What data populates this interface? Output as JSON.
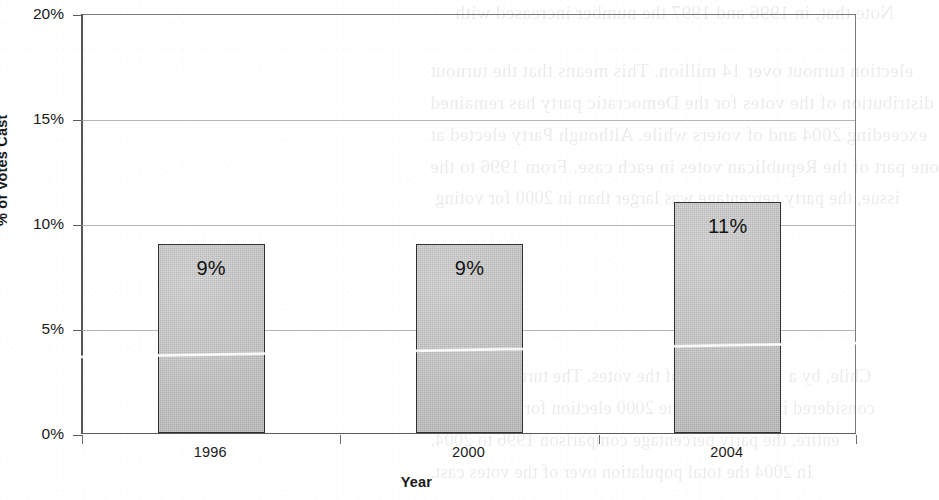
{
  "chart_data": {
    "type": "bar",
    "title": "",
    "subtitle": "",
    "categories": [
      "1996",
      "2000",
      "2004"
    ],
    "values": [
      9,
      9,
      11
    ],
    "data_labels": [
      "9%",
      "9%",
      "11%"
    ],
    "xlabel": "Year",
    "ylabel": "% of Votes Cast",
    "ylim": [
      0,
      20
    ],
    "ytick_values": [
      20,
      15,
      10,
      5,
      0
    ],
    "ytick_labels": [
      "20%",
      "15%",
      "10%",
      "5%",
      "0%"
    ],
    "grid": true,
    "grid_axis": "y",
    "legend": false,
    "legend_position": "none",
    "series": [
      {
        "name": "% of Votes Cast",
        "values": [
          9,
          9,
          11
        ]
      }
    ],
    "colors": {
      "bar_fill": "#c3c3c3",
      "bar_border": "#2f2f2f",
      "gridline": "#a9a9ad",
      "axis": "#55555a",
      "text": "#111111",
      "background": "#ffffff"
    }
  },
  "axes": {
    "y": {
      "title": "% of Votes Cast",
      "ticks": [
        {
          "label": "20%",
          "value": 20
        },
        {
          "label": "15%",
          "value": 15
        },
        {
          "label": "10%",
          "value": 10
        },
        {
          "label": "5%",
          "value": 5
        },
        {
          "label": "0%",
          "value": 0
        }
      ]
    },
    "x": {
      "title": "Year",
      "ticks": [
        {
          "label": "1996"
        },
        {
          "label": "2000"
        },
        {
          "label": "2004"
        }
      ]
    }
  },
  "bars": [
    {
      "category": "1996",
      "value": 9,
      "label": "9%"
    },
    {
      "category": "2000",
      "value": 9,
      "label": "9%"
    },
    {
      "category": "2004",
      "value": 11,
      "label": "11%"
    }
  ],
  "scan_ghost_text": [
    "Note that, in 1996 and 1997 the number increased with",
    "election turnout over 14 million. This means that the turnout",
    "distribution of the votes for the Democratic party has remained",
    "exceeding 2004 and of voters while. Although Party elected at",
    "one part of the Republican votes in each case. From 1996 to the",
    "issue, the party percentage was larger than in 2000 for voting",
    "Chile, by a 1974 percent of the votes. The turnout was not",
    "considered in the case of the 2000 election for the national",
    "entire, the party percentage comparison 1996 to 2004.",
    "In 2004 the total population over of the votes cast."
  ]
}
